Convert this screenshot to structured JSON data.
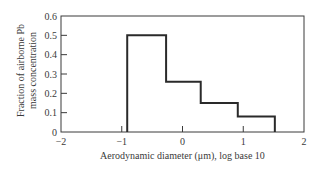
{
  "chart_data": {
    "type": "step",
    "title": "",
    "xlabel": "Aerodynamic diameter (μm), log base 10",
    "ylabel_lines": [
      "Fraction of airborne Pb",
      "mass concentration"
    ],
    "xlim": [
      -2,
      2
    ],
    "ylim": [
      0,
      0.6
    ],
    "grid": false,
    "legend": null,
    "x_ticks": [
      -2,
      -1,
      0,
      1,
      2
    ],
    "x_tick_labels": [
      "−2",
      "−1",
      "0",
      "1",
      "2"
    ],
    "y_ticks": [
      0,
      0.1,
      0.2,
      0.3,
      0.4,
      0.5,
      0.6
    ],
    "y_tick_labels": [
      "0",
      "0.1",
      "0.2",
      "0.3",
      "0.4",
      "0.5",
      "0.6"
    ],
    "bins": [
      {
        "x_start": -0.91,
        "x_end": -0.27,
        "value": 0.5
      },
      {
        "x_start": -0.27,
        "x_end": 0.3,
        "value": 0.26
      },
      {
        "x_start": 0.3,
        "x_end": 0.91,
        "value": 0.15
      },
      {
        "x_start": 0.91,
        "x_end": 1.52,
        "value": 0.08
      }
    ],
    "colors": {
      "line": "#2a2a2a",
      "frame": "#3a3a3a",
      "background": "#ffffff"
    }
  }
}
